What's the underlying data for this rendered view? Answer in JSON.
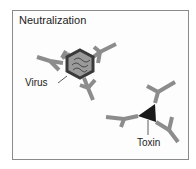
{
  "title": "Neutralization",
  "labels": {
    "virus": "Virus",
    "toxin": "Toxin"
  },
  "colors": {
    "antibody": "#8c8c8c",
    "virus_outline": "#3a3a3a",
    "virus_fill": "#9a9a9a",
    "toxin": "#1a1a1a",
    "border": "#8a8a8a"
  }
}
